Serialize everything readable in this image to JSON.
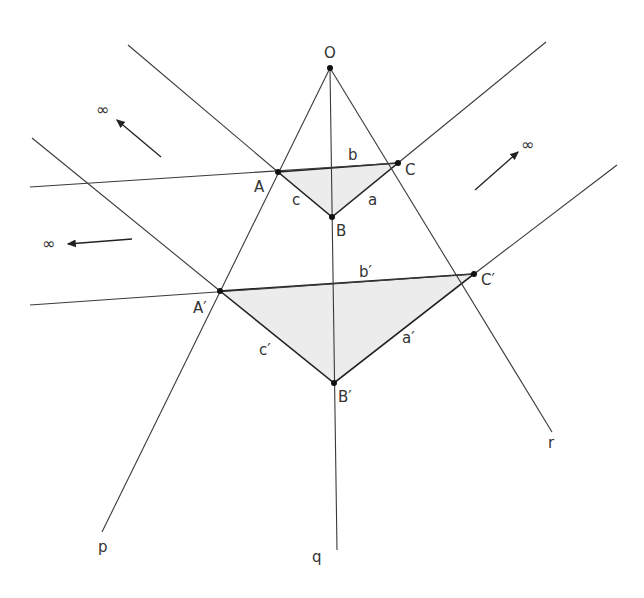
{
  "points": {
    "O": {
      "label": "O",
      "x": 330,
      "y": 68
    },
    "A": {
      "label": "A",
      "x": 278,
      "y": 172
    },
    "B": {
      "label": "B",
      "x": 332,
      "y": 217
    },
    "C": {
      "label": "C",
      "x": 398,
      "y": 163
    },
    "A2": {
      "label": "A′",
      "x": 220,
      "y": 291
    },
    "B2": {
      "label": "B′",
      "x": 334,
      "y": 383
    },
    "C2": {
      "label": "C′",
      "x": 474,
      "y": 274
    }
  },
  "sides": {
    "a": "a",
    "b": "b",
    "c": "c",
    "a2": "a′",
    "b2": "b′",
    "c2": "c′"
  },
  "lines": {
    "p": "p",
    "q": "q",
    "r": "r"
  },
  "infinity": {
    "symbol": "∞"
  }
}
